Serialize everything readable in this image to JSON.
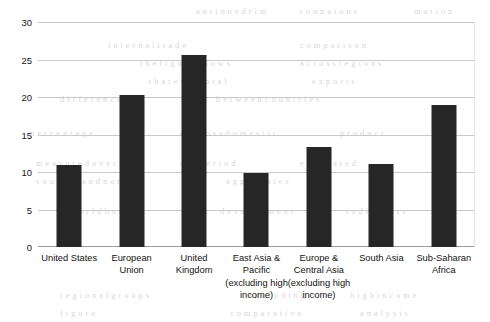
{
  "chart_data": {
    "type": "bar",
    "title": "",
    "subtitle": "",
    "xlabel": "",
    "ylabel": "",
    "ylim": [
      0,
      30
    ],
    "ytick_values": [
      0,
      5,
      10,
      15,
      20,
      25,
      30
    ],
    "ytick_labels": [
      "0",
      "5",
      "10",
      "15",
      "20",
      "25",
      "30"
    ],
    "grid": "horizontal",
    "legend": "none",
    "bar_color": "#262626",
    "gridline_color": "#c9c9c9",
    "categories": [
      "United States",
      "European Union",
      "United Kingdom",
      "East Asia & Pacific (excluding high income)",
      "Europe & Central Asia (excluding high income)",
      "South Asia",
      "Sub-Saharan Africa"
    ],
    "category_lines": [
      [
        "United States"
      ],
      [
        "European",
        "Union"
      ],
      [
        "United",
        "Kingdom"
      ],
      [
        "East Asia &",
        "Pacific",
        "(excluding high",
        "income)"
      ],
      [
        "Europe &",
        "Central Asia",
        "(excluding high",
        "income)"
      ],
      [
        "South Asia"
      ],
      [
        "Sub-Saharan",
        "Africa"
      ]
    ],
    "values": [
      10.9,
      20.3,
      25.6,
      9.9,
      13.3,
      11.1,
      18.9
    ]
  },
  "bleed_text": [
    {
      "t": "a  n  t  i  n  n  e  d   r  i  m",
      "x": 196,
      "y": 6
    },
    {
      "t": "r  o  u  n  a  i  o  n  s",
      "x": 300,
      "y": 6
    },
    {
      "t": "m  a  t  i  o  n",
      "x": 414,
      "y": 6
    },
    {
      "t": "i  n  t  e  r  n  a  l   t  r  a  d  e",
      "x": 108,
      "y": 40
    },
    {
      "t": "c  o  m  p  a  r  i  s  o  n",
      "x": 300,
      "y": 40
    },
    {
      "t": "t  h  e   f  i  g  u  r  e   s  h  o  w  s",
      "x": 140,
      "y": 58
    },
    {
      "t": "a  c  r  o  s  s   r  e  g  i  o  n  s",
      "x": 300,
      "y": 58
    },
    {
      "t": "s  h  a  r  e  s   o  f   t  o  t  a  l",
      "x": 148,
      "y": 76
    },
    {
      "t": "e  x  p  o  r  t  s",
      "x": 312,
      "y": 76
    },
    {
      "t": "d  i  f  f  e  r  e  n  c  e  s",
      "x": 60,
      "y": 94
    },
    {
      "t": "b  e  t  w  e  e  n   c  o  u  n  t  r  i  e  s",
      "x": 216,
      "y": 94
    },
    {
      "t": "p  e  r  c  e  n  t  a  g  e",
      "x": 30,
      "y": 128
    },
    {
      "t": "o  f   g  r  o  s  s   d  o  m  e  s  t  i  c",
      "x": 180,
      "y": 128
    },
    {
      "t": "p  r  o  d  u  c  t",
      "x": 340,
      "y": 128
    },
    {
      "t": "m  e  a  s  u  r  e  d   o  v  e  r",
      "x": 36,
      "y": 158
    },
    {
      "t": "t  h  e   p  e  r  i  o  d",
      "x": 180,
      "y": 158
    },
    {
      "t": "e  s  t  i  m  a  t  e  d",
      "x": 300,
      "y": 158
    },
    {
      "t": "s  o  u  r  c  e  s   a  n  d   n  o  t  e  s",
      "x": 36,
      "y": 176
    },
    {
      "t": "a  g  g  r  e  g  a  t  e  s",
      "x": 226,
      "y": 176
    },
    {
      "t": "w  o  r  l  d   b  a  n  k",
      "x": 70,
      "y": 206
    },
    {
      "t": "d  e  v  e  l  o  p  m  e  n  t",
      "x": 220,
      "y": 206
    },
    {
      "t": "i  n  d  i  c  a  t  o  r  s",
      "x": 346,
      "y": 206
    },
    {
      "t": "r  e  g  i  o  n  a  l   g  r  o  u  p  s",
      "x": 60,
      "y": 290
    },
    {
      "t": "e  x  c  l  u  d  i  n  g",
      "x": 248,
      "y": 290
    },
    {
      "t": "h  i  g  h   i  n  c  o  m  e",
      "x": 350,
      "y": 290
    },
    {
      "t": "f  i  g  u  r  e",
      "x": 60,
      "y": 308
    },
    {
      "t": "c  o  m  p  a  r  a  t  i  v  e",
      "x": 230,
      "y": 308
    },
    {
      "t": "a  n  a  l  y  s  i  s",
      "x": 360,
      "y": 308
    }
  ]
}
